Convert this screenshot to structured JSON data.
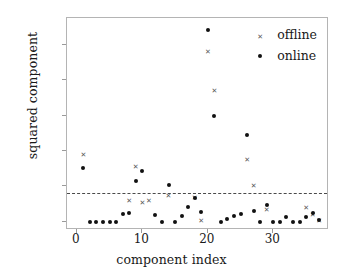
{
  "chart_data": {
    "type": "scatter",
    "title": "",
    "xlabel": "component index",
    "ylabel": "squared component",
    "xlim": [
      -1.5,
      38.5
    ],
    "ylim": [
      -0.012,
      0.288
    ],
    "grid": false,
    "legend_position": "top-right",
    "xticks": [
      0,
      10,
      20,
      30
    ],
    "xtick_labels": [
      "0",
      "10",
      "20",
      "30"
    ],
    "yticks": [
      0.0,
      0.05,
      0.1,
      0.15,
      0.2,
      0.25
    ],
    "ytick_labels": [
      "0.00",
      "0.05",
      "0.10",
      "0.15",
      "0.20",
      "0.25"
    ],
    "annotations": [
      {
        "name": "threshold-line",
        "type": "hline",
        "y": 0.04,
        "style": "dashed",
        "color": "#4a4a4a"
      }
    ],
    "series": [
      {
        "name": "offline",
        "marker": "x",
        "color": "#5a5a5a",
        "x": [
          1,
          8,
          9,
          10,
          11,
          14,
          18,
          19,
          20,
          21,
          26,
          27,
          29,
          35,
          36,
          37
        ],
        "y": [
          0.093,
          0.028,
          0.076,
          0.026,
          0.028,
          0.036,
          0.033,
          0.0,
          0.239,
          0.184,
          0.086,
          0.05,
          0.015,
          0.018,
          0.008,
          0.0
        ]
      },
      {
        "name": "online",
        "marker": "o",
        "color": "#111111",
        "x": [
          1,
          2,
          3,
          4,
          5,
          6,
          7,
          8,
          9,
          10,
          12,
          13,
          14,
          15,
          16,
          17,
          18,
          19,
          20,
          21,
          22,
          23,
          24,
          25,
          26,
          27,
          28,
          29,
          30,
          31,
          32,
          33,
          34,
          35,
          36,
          37
        ],
        "y": [
          0.076,
          0.0,
          0.0,
          0.0,
          0.0,
          0.0,
          0.011,
          0.012,
          0.058,
          0.072,
          0.009,
          0.0,
          0.052,
          0.0,
          0.008,
          0.021,
          0.033,
          0.014,
          0.271,
          0.15,
          0.0,
          0.004,
          0.008,
          0.011,
          0.122,
          0.015,
          0.0,
          0.023,
          0.0,
          0.0,
          0.006,
          0.0,
          0.0,
          0.007,
          0.012,
          0.002
        ]
      }
    ]
  },
  "legend": {
    "items": [
      {
        "label": "offline",
        "marker": "x"
      },
      {
        "label": "online",
        "marker": "o"
      }
    ]
  }
}
